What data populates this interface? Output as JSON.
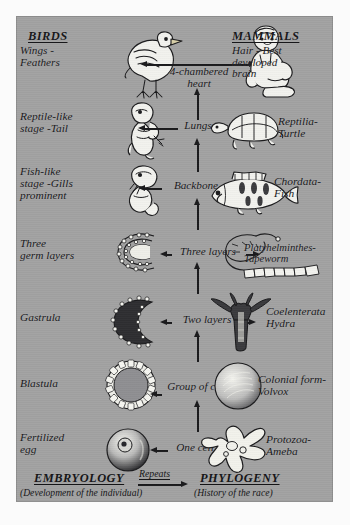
{
  "panel": {
    "background_color": "#a2a2a2",
    "ink_color": "#17171a"
  },
  "columns": {
    "left_heading": "BIRDS",
    "right_heading": "MAMMALS"
  },
  "rows": [
    {
      "id": "birds-mammals",
      "left_label": "BIRDS\nWings -\nFeathers",
      "left_title": "BIRDS",
      "left_sub": "Wings -\nFeathers",
      "left_figure": "chick-bird-icon",
      "middle_label": "4-chambered\nheart",
      "right_figure": "human-baby-icon",
      "right_title": "MAMMALS",
      "right_sub": "Hair - Best\ndeveloped\nbrain"
    },
    {
      "id": "reptile",
      "left_label": "Reptile-like\nstage -Tail",
      "left_figure": "reptile-embryo-icon",
      "middle_label": "Lungs",
      "right_figure": "turtle-icon",
      "right_label": "Reptilia-\nTurtle"
    },
    {
      "id": "fish",
      "left_label": "Fish-like\nstage -Gills\nprominent",
      "left_figure": "fish-embryo-icon",
      "middle_label": "Backbone",
      "right_figure": "fish-icon",
      "right_label": "Chordata-\nFish"
    },
    {
      "id": "three-germ-layers",
      "left_label": "Three\ngerm layers",
      "left_figure": "three-germ-layer-embryo-icon",
      "middle_label": "Three layers",
      "right_figure": "tapeworm-icon",
      "right_label": "Platyhelminthes-\nTapeworm"
    },
    {
      "id": "gastrula",
      "left_label": "Gastrula",
      "left_figure": "gastrula-icon",
      "middle_label": "Two layers",
      "right_figure": "hydra-icon",
      "right_label": "Coelenterata\nHydra"
    },
    {
      "id": "blastula",
      "left_label": "Blastula",
      "left_figure": "blastula-icon",
      "middle_label": "Group of cells",
      "right_figure": "volvox-icon",
      "right_label": "Colonial form-\nVolvox"
    },
    {
      "id": "fertilized-egg",
      "left_label": "Fertilized\negg",
      "left_figure": "fertilized-egg-icon",
      "middle_label": "One cell",
      "right_figure": "ameba-icon",
      "right_label": "Protozoa-\nAmeba"
    }
  ],
  "footer": {
    "left_title": "EMBRYOLOGY",
    "left_sub": "(Development of the individual)",
    "middle_label": "Repeats",
    "right_title": "PHYLOGENY",
    "right_sub": "(History of the race)"
  }
}
